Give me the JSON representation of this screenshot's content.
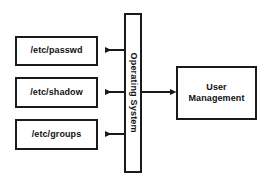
{
  "diagram": {
    "background_color": "#ffffff",
    "stroke_color": "#1a1a1a",
    "text_color": "#111111",
    "file_nodes": [
      {
        "id": "passwd",
        "label": "/etc/passwd",
        "x": 15,
        "y": 36,
        "w": 83,
        "h": 30
      },
      {
        "id": "shadow",
        "label": "/etc/shadow",
        "x": 15,
        "y": 77,
        "w": 83,
        "h": 31
      },
      {
        "id": "groups",
        "label": "/etc/groups",
        "x": 15,
        "y": 119,
        "w": 83,
        "h": 31
      }
    ],
    "os_node": {
      "id": "operating-system",
      "label": "Operating System",
      "x": 124,
      "y": 13,
      "w": 18,
      "h": 160,
      "text_orientation": "vertical-clockwise"
    },
    "user_management_node": {
      "id": "user-management",
      "label_line1": "User",
      "label_line2": "Management",
      "x": 176,
      "y": 66,
      "w": 81,
      "h": 54
    },
    "arrows": [
      {
        "id": "os-to-passwd",
        "direction": "left",
        "from_x": 124,
        "to_x": 98,
        "y": 50
      },
      {
        "id": "os-to-shadow",
        "direction": "left",
        "from_x": 124,
        "to_x": 98,
        "y": 92
      },
      {
        "id": "os-to-groups",
        "direction": "left",
        "from_x": 124,
        "to_x": 98,
        "y": 134
      },
      {
        "id": "os-to-user-management",
        "direction": "right",
        "from_x": 142,
        "to_x": 176,
        "y": 92
      }
    ]
  }
}
